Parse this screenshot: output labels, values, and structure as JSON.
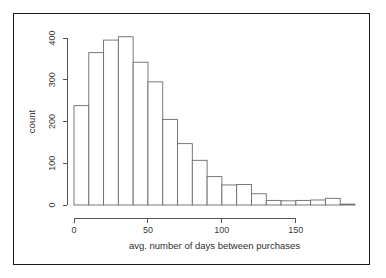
{
  "figure": {
    "kind": "histogram-figure",
    "border_color": "#1a1a1a",
    "background_color": "#ffffff"
  },
  "chart_data": {
    "type": "bar",
    "title": "",
    "subtitle": "",
    "xlabel": "avg. number of days between purchases",
    "ylabel": "count",
    "xlim": [
      0,
      190
    ],
    "ylim": [
      0,
      420
    ],
    "grid": false,
    "legend": null,
    "bin_width": 10,
    "x_ticks": [
      0,
      50,
      100,
      150
    ],
    "x_tick_labels": [
      "0",
      "50",
      "100",
      "150"
    ],
    "y_ticks": [
      0,
      100,
      200,
      300,
      400
    ],
    "y_tick_labels": [
      "0",
      "100",
      "200",
      "300",
      "400"
    ],
    "bar_fill": "#ffffff",
    "bar_stroke": "#6b6b6b",
    "axis_color": "#555555",
    "categories": [
      "0-10",
      "10-20",
      "20-30",
      "30-40",
      "40-50",
      "50-60",
      "60-70",
      "70-80",
      "80-90",
      "90-100",
      "100-110",
      "110-120",
      "120-130",
      "130-140",
      "140-150",
      "150-160",
      "160-170",
      "170-180",
      "180-190"
    ],
    "bin_edges": [
      0,
      10,
      20,
      30,
      40,
      50,
      60,
      70,
      80,
      90,
      100,
      110,
      120,
      130,
      140,
      150,
      160,
      170,
      180,
      190
    ],
    "values": [
      238,
      365,
      395,
      403,
      342,
      295,
      205,
      147,
      107,
      68,
      48,
      49,
      27,
      11,
      10,
      11,
      12,
      16,
      2
    ]
  }
}
